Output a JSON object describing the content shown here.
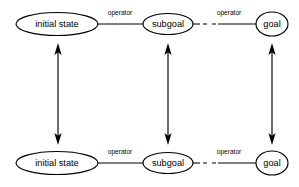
{
  "figure": {
    "background_color": "#ffffff",
    "stroke_color": "#000000",
    "width": 299,
    "height": 187
  },
  "rows": [
    {
      "id": "top-row",
      "y": 24,
      "nodes": [
        {
          "id": "initial-state",
          "label": "initial state",
          "shape": "ellipse",
          "cx": 57,
          "cy": 24,
          "rx": 41,
          "ry": 11.5
        },
        {
          "id": "subgoal",
          "label": "subgoal",
          "shape": "ellipse",
          "cx": 168,
          "cy": 24,
          "rx": 25,
          "ry": 10.5
        },
        {
          "id": "goal",
          "label": "goal",
          "shape": "ellipse",
          "cx": 272,
          "cy": 24,
          "rx": 16,
          "ry": 12
        }
      ],
      "edges": [
        {
          "id": "edge-initial-subgoal",
          "label": "operator",
          "style": "solid",
          "label_x": 120,
          "label_y": 15
        },
        {
          "id": "edge-subgoal-goal",
          "label": "operator",
          "style": "dashed-then-solid",
          "label_x": 229,
          "label_y": 15
        }
      ]
    },
    {
      "id": "bottom-row",
      "y": 163,
      "nodes": [
        {
          "id": "initial-state",
          "label": "initial state",
          "shape": "ellipse",
          "cx": 57,
          "cy": 163,
          "rx": 41,
          "ry": 11.5
        },
        {
          "id": "subgoal",
          "label": "subgoal",
          "shape": "ellipse",
          "cx": 168,
          "cy": 163,
          "rx": 25,
          "ry": 10.5
        },
        {
          "id": "goal",
          "label": "goal",
          "shape": "ellipse",
          "cx": 272,
          "cy": 163,
          "rx": 16,
          "ry": 12
        }
      ],
      "edges": [
        {
          "id": "edge-initial-subgoal",
          "label": "operator",
          "style": "solid",
          "label_x": 120,
          "label_y": 154
        },
        {
          "id": "edge-subgoal-goal",
          "label": "operator",
          "style": "dashed-then-solid",
          "label_x": 229,
          "label_y": 154
        }
      ]
    }
  ],
  "vertical_connectors": [
    {
      "id": "connector-initial-state",
      "x": 58,
      "y_top": 47,
      "y_bottom": 141,
      "arrowheads": "both"
    },
    {
      "id": "connector-subgoal",
      "x": 168,
      "y_top": 47,
      "y_bottom": 141,
      "arrowheads": "both"
    },
    {
      "id": "connector-goal",
      "x": 272,
      "y_top": 47,
      "y_bottom": 141,
      "arrowheads": "both"
    }
  ]
}
